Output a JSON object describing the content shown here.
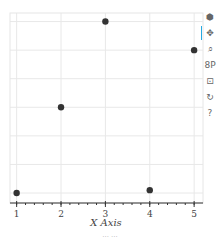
{
  "chart_data": {
    "type": "scatter",
    "title": "",
    "xlabel": "X Axis",
    "ylabel": "",
    "x": [
      1,
      2,
      3,
      4,
      5
    ],
    "y": [
      0,
      3,
      6,
      0.1,
      5
    ],
    "xticks": [
      "1",
      "2",
      "3",
      "4",
      "5"
    ],
    "xlim": [
      0.85,
      5.2
    ],
    "ylim": [
      -0.35,
      6.3
    ],
    "grid": true,
    "marker_color": "#333333",
    "legend": null
  },
  "toolbar": {
    "tools": [
      {
        "name": "bokeh-logo-icon",
        "glyph": "⬢"
      },
      {
        "name": "pan-icon",
        "glyph": "✥"
      },
      {
        "name": "box-zoom-icon",
        "glyph": "⌕"
      },
      {
        "name": "wheel-zoom-icon",
        "glyph": "8P"
      },
      {
        "name": "save-icon",
        "glyph": "⊡"
      },
      {
        "name": "reset-icon",
        "glyph": "↻"
      },
      {
        "name": "help-icon",
        "glyph": "?"
      }
    ]
  },
  "caption": "··· ···"
}
